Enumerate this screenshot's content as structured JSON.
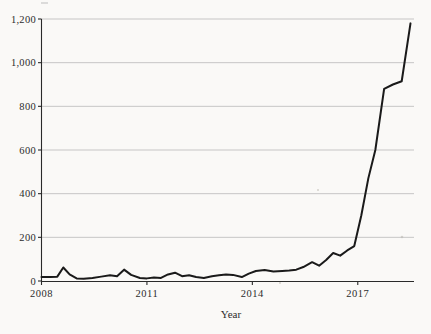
{
  "chart_data": {
    "type": "line",
    "title": "",
    "subtitle": "",
    "xlabel": "Year",
    "ylabel": "",
    "xlim": [
      2008.0,
      2018.6
    ],
    "ylim": [
      0,
      1200
    ],
    "grid": true,
    "legend": null,
    "y_ticks": [
      0,
      200,
      400,
      600,
      800,
      1000,
      1200
    ],
    "y_tick_labels": [
      "0",
      "200",
      "400",
      "600",
      "800",
      "1,000",
      "1,200"
    ],
    "x_ticks": [
      2008,
      2011,
      2014,
      2017
    ],
    "x_tick_labels": [
      "2008",
      "2011",
      "2014",
      "2017"
    ],
    "series": [
      {
        "name": "count",
        "color": "#1a1a1a",
        "x": [
          2008.0,
          2008.25,
          2008.45,
          2008.62,
          2008.8,
          2009.0,
          2009.2,
          2009.45,
          2009.7,
          2009.95,
          2010.15,
          2010.35,
          2010.55,
          2010.8,
          2011.0,
          2011.2,
          2011.4,
          2011.6,
          2011.8,
          2012.0,
          2012.2,
          2012.4,
          2012.62,
          2012.85,
          2013.05,
          2013.25,
          2013.45,
          2013.7,
          2013.9,
          2014.1,
          2014.35,
          2014.6,
          2014.85,
          2015.05,
          2015.25,
          2015.45,
          2015.7,
          2015.9,
          2016.1,
          2016.3,
          2016.5,
          2016.7,
          2016.9,
          2017.1,
          2017.3,
          2017.5,
          2017.75,
          2018.0,
          2018.25,
          2018.5
        ],
        "y": [
          18,
          18,
          20,
          62,
          30,
          12,
          10,
          14,
          20,
          26,
          22,
          52,
          28,
          14,
          12,
          16,
          14,
          30,
          38,
          22,
          26,
          18,
          14,
          22,
          26,
          30,
          28,
          18,
          34,
          46,
          50,
          44,
          46,
          48,
          52,
          64,
          86,
          70,
          96,
          128,
          116,
          140,
          160,
          300,
          470,
          600,
          880,
          900,
          915,
          1180
        ]
      }
    ]
  },
  "decor": {
    "top_mark": "clipped-mark",
    "speck": "paper-speck"
  }
}
